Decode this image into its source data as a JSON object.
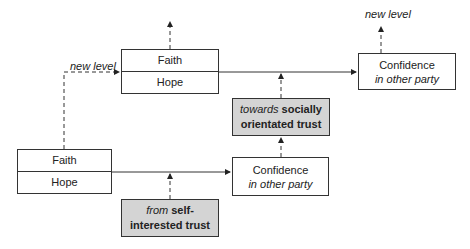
{
  "diagram": {
    "top_left_box": {
      "line1": "Faith",
      "line2": "Hope"
    },
    "top_right_box": {
      "line1": "Confidence",
      "line2": "in other party"
    },
    "bottom_left_box": {
      "line1": "Faith",
      "line2": "Hope"
    },
    "bottom_mid_box": {
      "line1": "Confidence",
      "line2": "in other party"
    },
    "towards_box": {
      "italic": "towards",
      "bold1": "socially",
      "bold2": "orientated trust"
    },
    "from_box": {
      "italic": "from",
      "bold1": "self-",
      "bold2": "interested trust"
    },
    "labels": {
      "new_level_left": "new level",
      "new_level_right": "new level"
    },
    "colors": {
      "line": "#333333",
      "gray_fill": "#d4d4d4"
    }
  }
}
